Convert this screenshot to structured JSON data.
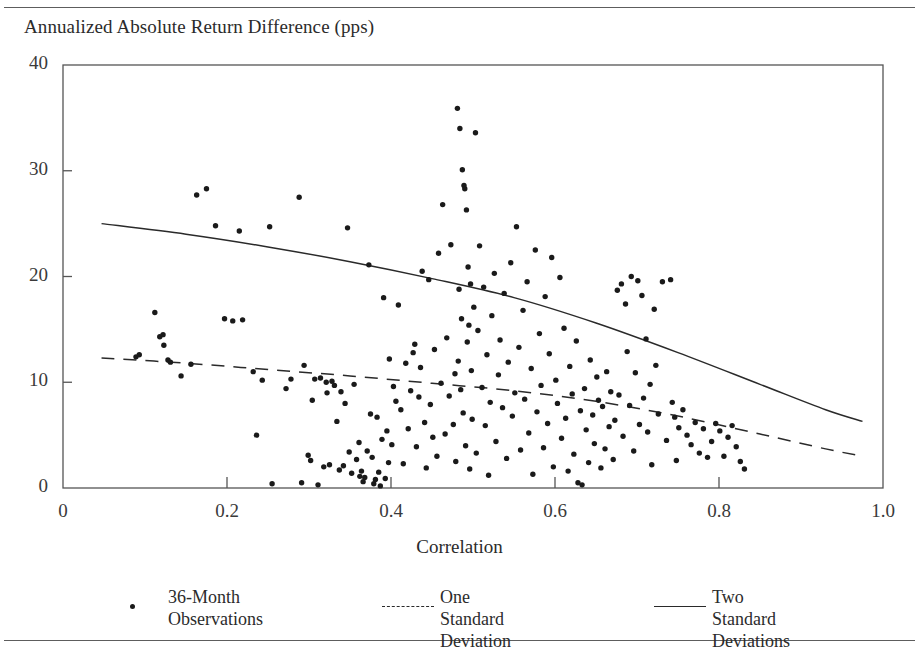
{
  "figure": {
    "clipped_header_text": "",
    "background_color": "#ffffff",
    "rule_color": "#5d5d5d"
  },
  "chart_data": {
    "type": "scatter",
    "title": "",
    "subtitle": "",
    "xlabel": "Correlation",
    "ylabel": "Annualized Absolute Return Difference (pps)",
    "xlim": [
      0,
      1.0
    ],
    "ylim": [
      0,
      40
    ],
    "xticks": [
      0,
      0.2,
      0.4,
      0.6,
      0.8,
      1.0
    ],
    "xticklabels": [
      "0",
      "0.2",
      "0.4",
      "0.6",
      "0.8",
      "1.0"
    ],
    "yticks": [
      0,
      10,
      20,
      30,
      40
    ],
    "yticklabels": [
      "0",
      "10",
      "20",
      "30",
      "40"
    ],
    "grid": false,
    "legend_position": "below-axes",
    "marker_color": "#1a1a1a",
    "line_color": "#2a2a2a",
    "series": [
      {
        "name": "36-Month Observations",
        "type": "scatter",
        "marker": "dot",
        "points": [
          [
            0.089,
            12.4
          ],
          [
            0.093,
            12.6
          ],
          [
            0.112,
            16.6
          ],
          [
            0.118,
            14.3
          ],
          [
            0.122,
            14.5
          ],
          [
            0.123,
            13.5
          ],
          [
            0.128,
            12.1
          ],
          [
            0.131,
            11.9
          ],
          [
            0.144,
            10.6
          ],
          [
            0.156,
            11.7
          ],
          [
            0.175,
            28.3
          ],
          [
            0.163,
            27.7
          ],
          [
            0.186,
            24.8
          ],
          [
            0.197,
            16.0
          ],
          [
            0.207,
            15.8
          ],
          [
            0.215,
            24.3
          ],
          [
            0.219,
            15.9
          ],
          [
            0.232,
            11.0
          ],
          [
            0.236,
            5.0
          ],
          [
            0.243,
            10.2
          ],
          [
            0.252,
            24.7
          ],
          [
            0.255,
            0.4
          ],
          [
            0.272,
            9.4
          ],
          [
            0.278,
            10.3
          ],
          [
            0.288,
            27.5
          ],
          [
            0.291,
            0.5
          ],
          [
            0.294,
            11.6
          ],
          [
            0.299,
            3.1
          ],
          [
            0.302,
            2.6
          ],
          [
            0.304,
            8.3
          ],
          [
            0.307,
            10.3
          ],
          [
            0.311,
            0.3
          ],
          [
            0.314,
            10.4
          ],
          [
            0.318,
            2.0
          ],
          [
            0.321,
            10.0
          ],
          [
            0.322,
            9.0
          ],
          [
            0.325,
            2.2
          ],
          [
            0.328,
            10.1
          ],
          [
            0.331,
            9.7
          ],
          [
            0.334,
            6.3
          ],
          [
            0.337,
            1.7
          ],
          [
            0.339,
            9.1
          ],
          [
            0.342,
            2.1
          ],
          [
            0.344,
            8.0
          ],
          [
            0.347,
            24.6
          ],
          [
            0.349,
            3.4
          ],
          [
            0.352,
            1.4
          ],
          [
            0.355,
            9.8
          ],
          [
            0.358,
            2.7
          ],
          [
            0.361,
            4.3
          ],
          [
            0.362,
            1.1
          ],
          [
            0.364,
            1.6
          ],
          [
            0.366,
            0.6
          ],
          [
            0.368,
            1.0
          ],
          [
            0.371,
            3.5
          ],
          [
            0.373,
            21.1
          ],
          [
            0.375,
            7.0
          ],
          [
            0.377,
            2.9
          ],
          [
            0.379,
            0.4
          ],
          [
            0.381,
            0.8
          ],
          [
            0.383,
            6.7
          ],
          [
            0.385,
            1.5
          ],
          [
            0.387,
            0.2
          ],
          [
            0.389,
            4.6
          ],
          [
            0.391,
            18.0
          ],
          [
            0.393,
            0.9
          ],
          [
            0.395,
            5.4
          ],
          [
            0.397,
            2.4
          ],
          [
            0.398,
            12.2
          ],
          [
            0.401,
            4.1
          ],
          [
            0.403,
            9.6
          ],
          [
            0.406,
            8.2
          ],
          [
            0.409,
            17.3
          ],
          [
            0.412,
            7.4
          ],
          [
            0.415,
            2.3
          ],
          [
            0.418,
            11.8
          ],
          [
            0.421,
            5.6
          ],
          [
            0.424,
            9.2
          ],
          [
            0.427,
            12.8
          ],
          [
            0.429,
            13.6
          ],
          [
            0.431,
            3.9
          ],
          [
            0.434,
            8.6
          ],
          [
            0.436,
            11.4
          ],
          [
            0.438,
            20.5
          ],
          [
            0.441,
            6.2
          ],
          [
            0.443,
            1.9
          ],
          [
            0.446,
            19.7
          ],
          [
            0.448,
            7.9
          ],
          [
            0.451,
            4.8
          ],
          [
            0.453,
            13.1
          ],
          [
            0.456,
            3.0
          ],
          [
            0.458,
            22.2
          ],
          [
            0.461,
            9.9
          ],
          [
            0.463,
            26.8
          ],
          [
            0.466,
            5.1
          ],
          [
            0.468,
            14.2
          ],
          [
            0.471,
            8.7
          ],
          [
            0.473,
            23.0
          ],
          [
            0.476,
            6.0
          ],
          [
            0.478,
            10.8
          ],
          [
            0.479,
            2.5
          ],
          [
            0.481,
            35.9
          ],
          [
            0.482,
            12.0
          ],
          [
            0.483,
            18.8
          ],
          [
            0.484,
            34.0
          ],
          [
            0.485,
            9.3
          ],
          [
            0.486,
            16.0
          ],
          [
            0.487,
            30.1
          ],
          [
            0.488,
            7.1
          ],
          [
            0.489,
            28.6
          ],
          [
            0.49,
            28.3
          ],
          [
            0.491,
            4.0
          ],
          [
            0.492,
            26.3
          ],
          [
            0.493,
            13.8
          ],
          [
            0.494,
            20.9
          ],
          [
            0.495,
            15.4
          ],
          [
            0.496,
            1.8
          ],
          [
            0.497,
            19.3
          ],
          [
            0.498,
            11.1
          ],
          [
            0.499,
            6.5
          ],
          [
            0.501,
            17.1
          ],
          [
            0.503,
            33.6
          ],
          [
            0.504,
            3.3
          ],
          [
            0.506,
            14.9
          ],
          [
            0.508,
            22.9
          ],
          [
            0.511,
            9.5
          ],
          [
            0.513,
            19.0
          ],
          [
            0.515,
            5.9
          ],
          [
            0.517,
            12.6
          ],
          [
            0.519,
            1.2
          ],
          [
            0.521,
            8.1
          ],
          [
            0.523,
            16.3
          ],
          [
            0.526,
            20.3
          ],
          [
            0.528,
            4.4
          ],
          [
            0.531,
            10.7
          ],
          [
            0.533,
            14.0
          ],
          [
            0.536,
            7.6
          ],
          [
            0.538,
            18.4
          ],
          [
            0.541,
            2.8
          ],
          [
            0.543,
            11.9
          ],
          [
            0.546,
            21.3
          ],
          [
            0.548,
            6.8
          ],
          [
            0.551,
            9.0
          ],
          [
            0.553,
            24.7
          ],
          [
            0.556,
            13.3
          ],
          [
            0.558,
            3.6
          ],
          [
            0.561,
            16.8
          ],
          [
            0.563,
            8.4
          ],
          [
            0.566,
            19.5
          ],
          [
            0.568,
            5.2
          ],
          [
            0.571,
            11.3
          ],
          [
            0.573,
            1.3
          ],
          [
            0.576,
            22.5
          ],
          [
            0.578,
            7.2
          ],
          [
            0.581,
            14.6
          ],
          [
            0.583,
            9.7
          ],
          [
            0.586,
            3.8
          ],
          [
            0.588,
            18.1
          ],
          [
            0.591,
            6.1
          ],
          [
            0.593,
            12.7
          ],
          [
            0.596,
            21.8
          ],
          [
            0.598,
            2.0
          ],
          [
            0.601,
            10.2
          ],
          [
            0.603,
            8.0
          ],
          [
            0.606,
            19.9
          ],
          [
            0.608,
            4.7
          ],
          [
            0.611,
            15.1
          ],
          [
            0.613,
            6.6
          ],
          [
            0.616,
            1.6
          ],
          [
            0.618,
            11.5
          ],
          [
            0.621,
            8.9
          ],
          [
            0.623,
            3.2
          ],
          [
            0.626,
            13.9
          ],
          [
            0.628,
            0.5
          ],
          [
            0.631,
            7.3
          ],
          [
            0.633,
            0.3
          ],
          [
            0.636,
            9.4
          ],
          [
            0.638,
            5.5
          ],
          [
            0.641,
            2.4
          ],
          [
            0.643,
            12.1
          ],
          [
            0.646,
            6.9
          ],
          [
            0.648,
            4.2
          ],
          [
            0.651,
            10.5
          ],
          [
            0.653,
            8.3
          ],
          [
            0.656,
            1.9
          ],
          [
            0.658,
            7.7
          ],
          [
            0.661,
            3.7
          ],
          [
            0.663,
            11.0
          ],
          [
            0.666,
            5.8
          ],
          [
            0.668,
            9.1
          ],
          [
            0.671,
            2.7
          ],
          [
            0.673,
            6.4
          ],
          [
            0.676,
            18.7
          ],
          [
            0.678,
            8.8
          ],
          [
            0.681,
            19.3
          ],
          [
            0.683,
            4.9
          ],
          [
            0.686,
            17.4
          ],
          [
            0.688,
            12.9
          ],
          [
            0.691,
            7.8
          ],
          [
            0.693,
            20.0
          ],
          [
            0.696,
            3.5
          ],
          [
            0.698,
            10.9
          ],
          [
            0.701,
            19.6
          ],
          [
            0.703,
            6.0
          ],
          [
            0.706,
            18.2
          ],
          [
            0.708,
            8.5
          ],
          [
            0.711,
            14.1
          ],
          [
            0.713,
            5.3
          ],
          [
            0.716,
            9.8
          ],
          [
            0.718,
            2.2
          ],
          [
            0.721,
            16.9
          ],
          [
            0.723,
            11.6
          ],
          [
            0.726,
            7.0
          ],
          [
            0.731,
            19.5
          ],
          [
            0.736,
            4.5
          ],
          [
            0.741,
            19.7
          ],
          [
            0.743,
            8.1
          ],
          [
            0.746,
            6.7
          ],
          [
            0.748,
            2.6
          ],
          [
            0.751,
            5.7
          ],
          [
            0.756,
            7.4
          ],
          [
            0.761,
            5.0
          ],
          [
            0.766,
            4.1
          ],
          [
            0.771,
            6.2
          ],
          [
            0.776,
            3.3
          ],
          [
            0.781,
            5.6
          ],
          [
            0.786,
            2.9
          ],
          [
            0.791,
            4.4
          ],
          [
            0.796,
            6.1
          ],
          [
            0.801,
            5.4
          ],
          [
            0.806,
            3.0
          ],
          [
            0.811,
            4.8
          ],
          [
            0.816,
            5.9
          ],
          [
            0.821,
            3.9
          ],
          [
            0.826,
            2.5
          ],
          [
            0.831,
            1.8
          ]
        ]
      },
      {
        "name": "One Standard Deviation",
        "type": "line",
        "style": "dashed",
        "points": [
          [
            0.047,
            12.3
          ],
          [
            0.15,
            11.8
          ],
          [
            0.25,
            11.2
          ],
          [
            0.35,
            10.6
          ],
          [
            0.45,
            9.9
          ],
          [
            0.55,
            9.2
          ],
          [
            0.65,
            8.2
          ],
          [
            0.75,
            6.8
          ],
          [
            0.85,
            5.1
          ],
          [
            0.93,
            3.7
          ],
          [
            0.975,
            3.0
          ]
        ]
      },
      {
        "name": "Two Standard Deviations",
        "type": "line",
        "style": "solid",
        "points": [
          [
            0.047,
            25.0
          ],
          [
            0.15,
            24.0
          ],
          [
            0.25,
            22.8
          ],
          [
            0.35,
            21.4
          ],
          [
            0.45,
            19.8
          ],
          [
            0.55,
            18.0
          ],
          [
            0.65,
            15.6
          ],
          [
            0.75,
            12.8
          ],
          [
            0.85,
            9.8
          ],
          [
            0.93,
            7.4
          ],
          [
            0.975,
            6.3
          ]
        ]
      }
    ]
  },
  "legend": {
    "entries": [
      {
        "label": "36-Month\nObservations",
        "marker": "dot-marker"
      },
      {
        "label": "One Standard\nDeviation",
        "marker": "dashed-line-marker"
      },
      {
        "label": "Two Standard\nDeviations",
        "marker": "solid-line-marker"
      }
    ]
  }
}
